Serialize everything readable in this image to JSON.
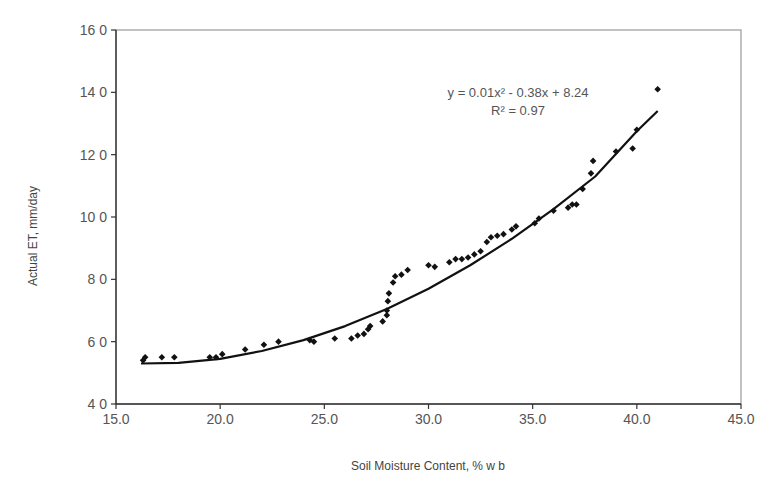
{
  "chart_data": {
    "type": "scatter",
    "title": "",
    "xlabel": "Soil Moisture Content, % w b",
    "ylabel": "Actual ET, mm/day",
    "xlim": [
      15.0,
      45.0
    ],
    "ylim": [
      4.0,
      16.0
    ],
    "x_ticks": [
      "15.0",
      "20.0",
      "25.0",
      "30.0",
      "35.0",
      "40.0",
      "45.0"
    ],
    "y_ticks": [
      "4 0",
      "6 0",
      "8 0",
      "10 0",
      "12 0",
      "14 0",
      "16 0"
    ],
    "grid": false,
    "legend": null,
    "series": [
      {
        "name": "Observed",
        "marker": "diamond",
        "color": "#111111",
        "points": [
          [
            16.3,
            5.4
          ],
          [
            16.4,
            5.5
          ],
          [
            17.2,
            5.5
          ],
          [
            17.8,
            5.5
          ],
          [
            19.5,
            5.5
          ],
          [
            19.8,
            5.5
          ],
          [
            20.1,
            5.6
          ],
          [
            21.2,
            5.75
          ],
          [
            22.1,
            5.9
          ],
          [
            22.8,
            6.0
          ],
          [
            24.3,
            6.05
          ],
          [
            24.5,
            6.0
          ],
          [
            25.5,
            6.1
          ],
          [
            26.3,
            6.1
          ],
          [
            26.6,
            6.2
          ],
          [
            26.9,
            6.25
          ],
          [
            27.1,
            6.4
          ],
          [
            27.2,
            6.5
          ],
          [
            27.8,
            6.65
          ],
          [
            28.0,
            6.85
          ],
          [
            28.0,
            7.0
          ],
          [
            28.05,
            7.3
          ],
          [
            28.1,
            7.55
          ],
          [
            28.3,
            7.9
          ],
          [
            28.4,
            8.1
          ],
          [
            28.7,
            8.15
          ],
          [
            29.0,
            8.3
          ],
          [
            30.0,
            8.45
          ],
          [
            30.3,
            8.4
          ],
          [
            31.0,
            8.55
          ],
          [
            31.3,
            8.65
          ],
          [
            31.6,
            8.65
          ],
          [
            31.9,
            8.7
          ],
          [
            32.2,
            8.8
          ],
          [
            32.5,
            8.9
          ],
          [
            32.8,
            9.2
          ],
          [
            33.0,
            9.35
          ],
          [
            33.3,
            9.4
          ],
          [
            33.6,
            9.45
          ],
          [
            34.0,
            9.6
          ],
          [
            34.2,
            9.7
          ],
          [
            35.1,
            9.8
          ],
          [
            35.3,
            9.95
          ],
          [
            36.0,
            10.2
          ],
          [
            36.7,
            10.3
          ],
          [
            36.9,
            10.4
          ],
          [
            37.1,
            10.4
          ],
          [
            37.4,
            10.9
          ],
          [
            37.8,
            11.4
          ],
          [
            37.9,
            11.8
          ],
          [
            39.0,
            12.1
          ],
          [
            39.8,
            12.2
          ],
          [
            40.0,
            12.8
          ],
          [
            41.0,
            14.1
          ]
        ]
      },
      {
        "name": "Polynomial trendline",
        "type": "line",
        "color": "#111111",
        "x_range": [
          16.2,
          41.0
        ],
        "points": [
          [
            16.2,
            5.3
          ],
          [
            18.0,
            5.32
          ],
          [
            20.0,
            5.45
          ],
          [
            22.0,
            5.7
          ],
          [
            24.0,
            6.05
          ],
          [
            26.0,
            6.5
          ],
          [
            28.0,
            7.05
          ],
          [
            30.0,
            7.7
          ],
          [
            32.0,
            8.45
          ],
          [
            34.0,
            9.3
          ],
          [
            36.0,
            10.25
          ],
          [
            38.0,
            11.3
          ],
          [
            40.0,
            12.75
          ],
          [
            41.0,
            13.4
          ]
        ]
      }
    ],
    "annotations": [
      {
        "text": "y = 0.01x² - 0.38x + 8.24",
        "x": 35.0,
        "y": 14.0
      },
      {
        "text": "R² = 0.97",
        "x": 35.0,
        "y": 13.4
      }
    ]
  },
  "labels": {
    "equation": "y = 0.01x² - 0.38x + 8.24",
    "r_squared": "R² = 0.97",
    "x_axis_title": "Soil Moisture Content, % w b",
    "y_axis_title": "Actual ET, mm/day"
  }
}
